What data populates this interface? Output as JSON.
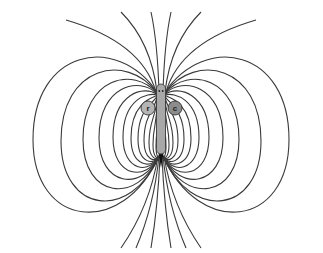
{
  "diagram": {
    "labels": {
      "left_organ": "r",
      "right_organ": "c"
    },
    "colors": {
      "background": "#ffffff",
      "field_line": "#3a3a3a",
      "fish_body": "#a8a8a8",
      "organ_r": "#b5b5b5",
      "organ_c": "#8c8c8c",
      "tail": "#111111"
    },
    "geometry": {
      "center_x": 161,
      "head_y": 86,
      "tail_y": 158,
      "loop_count_per_side": 12,
      "open_lines_top": 6,
      "open_lines_bottom": 6
    }
  }
}
